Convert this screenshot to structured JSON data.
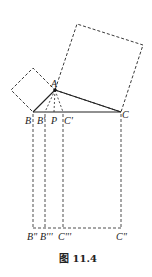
{
  "figure": {
    "caption": "图 11.4",
    "colors": {
      "stroke": "#222222",
      "background": "#ffffff"
    },
    "labels": {
      "A": "A",
      "B": "B",
      "B1": "B'",
      "P": "P",
      "C1": "C'",
      "C": "C",
      "B2": "B\"",
      "B3": "B'''",
      "C3": "C'''",
      "C2": "C\""
    },
    "points": {
      "A": [
        55,
        90
      ],
      "B": [
        33,
        112
      ],
      "C": [
        121,
        112
      ],
      "B1": [
        45,
        112
      ],
      "P": [
        54,
        112
      ],
      "C1": [
        63,
        112
      ]
    }
  }
}
